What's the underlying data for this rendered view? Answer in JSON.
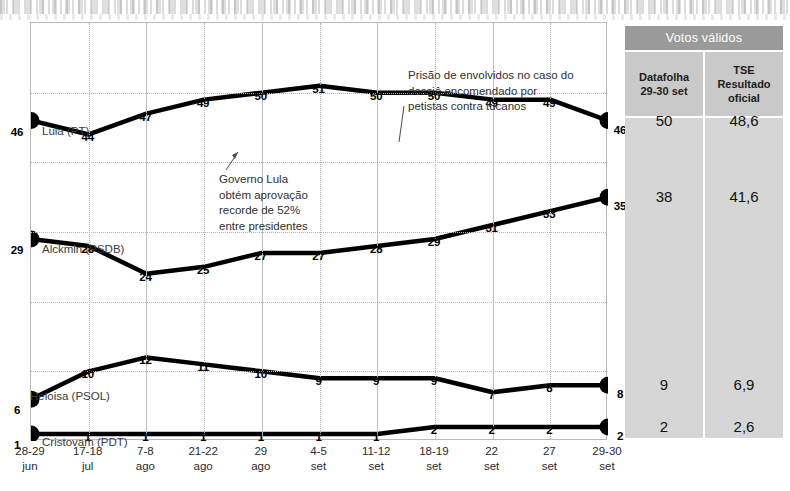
{
  "chart_data": {
    "type": "line",
    "title": "",
    "xlabel": "",
    "ylabel": "",
    "ylim": [
      0,
      60
    ],
    "grid": true,
    "legend": "inline-series-labels",
    "categories": [
      "28-29\njun",
      "17-18\njul",
      "7-8\nago",
      "21-22\nago",
      "29\nago",
      "4-5\nset",
      "11-12\nset",
      "18-19\nset",
      "22\nset",
      "27\nset",
      "29-30\nset"
    ],
    "series": [
      {
        "name": "Lula (PT)",
        "values": [
          46,
          44,
          47,
          49,
          50,
          51,
          50,
          50,
          49,
          49,
          46
        ]
      },
      {
        "name": "Alckmin (PSDB)",
        "values": [
          29,
          28,
          24,
          25,
          27,
          27,
          28,
          29,
          31,
          33,
          35
        ]
      },
      {
        "name": "Heloisa (PSOL)",
        "values": [
          6,
          10,
          12,
          11,
          10,
          9,
          9,
          9,
          7,
          8,
          8
        ]
      },
      {
        "name": "Cristovam (PDT)",
        "values": [
          1,
          1,
          1,
          1,
          1,
          1,
          1,
          2,
          2,
          2,
          2
        ]
      }
    ],
    "annotations": [
      "Prisão de envolvidos no caso do\ndossiê encomendado por\npetistas contra tucanos",
      "Governo Lula\nobtém aprovação\nrecorde de 52%\nentre presidentes"
    ]
  },
  "table": {
    "title": "Votos válidos",
    "columns": [
      "Datafolha\n29-30 set",
      "TSE\nResultado\noficial"
    ],
    "rows": [
      {
        "datafolha": "50",
        "tse": "48,6"
      },
      {
        "datafolha": "38",
        "tse": "41,6"
      },
      {
        "datafolha": "9",
        "tse": "6,9"
      },
      {
        "datafolha": "2",
        "tse": "2,6"
      }
    ]
  },
  "colors": {
    "line": "#000000",
    "grid": "#b5b5b5",
    "table_title_bg": "#9a9a9a",
    "table_head_bg": "#c9c9c9",
    "table_body_bg": "#d6d6d6"
  }
}
